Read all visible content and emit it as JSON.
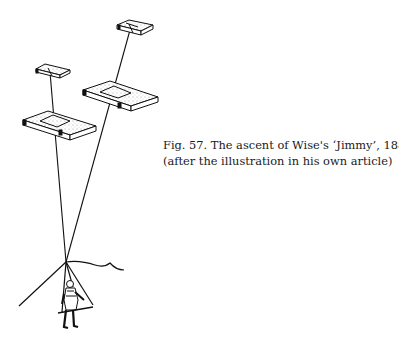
{
  "figure": {
    "caption_line1": "Fig. 57. The ascent of Wise's ‘Jimmy’, 1886",
    "caption_line2": "(after the illustration in his own article)"
  }
}
